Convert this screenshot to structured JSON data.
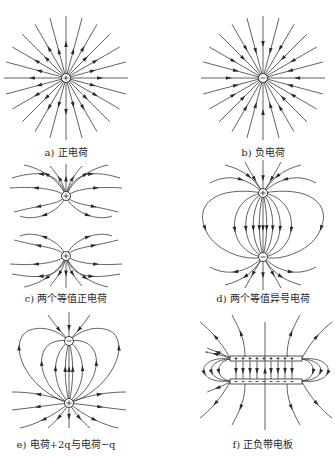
{
  "figure": {
    "panels": [
      {
        "id": "a",
        "caption": "a) 正电荷",
        "type": "single-positive-charge",
        "charges": [
          {
            "sign": "+",
            "x": 66,
            "y": 78
          }
        ],
        "field_direction": "outward"
      },
      {
        "id": "b",
        "caption": "b) 负电荷",
        "type": "single-negative-charge",
        "charges": [
          {
            "sign": "-",
            "x": 263,
            "y": 78
          }
        ],
        "field_direction": "inward"
      },
      {
        "id": "c",
        "caption": "c) 两个等值正电荷",
        "type": "two-equal-positive-charges",
        "charges": [
          {
            "sign": "+",
            "x": 66,
            "y": 196
          },
          {
            "sign": "+",
            "x": 66,
            "y": 256
          }
        ]
      },
      {
        "id": "d",
        "caption": "d) 两个等值异号电荷",
        "type": "dipole",
        "charges": [
          {
            "sign": "+",
            "x": 263,
            "y": 193
          },
          {
            "sign": "-",
            "x": 263,
            "y": 257
          }
        ]
      },
      {
        "id": "e",
        "caption": "e) 电荷+2q与电荷−q",
        "type": "unequal-charges",
        "charges": [
          {
            "sign": "-",
            "x": 69,
            "y": 341
          },
          {
            "sign": "+",
            "x": 69,
            "y": 403
          }
        ]
      },
      {
        "id": "f",
        "caption": "f) 正负带电板",
        "type": "charged-plates",
        "plates": [
          {
            "sign": "+",
            "y": 358
          },
          {
            "sign": "-",
            "y": 381
          }
        ]
      }
    ]
  }
}
